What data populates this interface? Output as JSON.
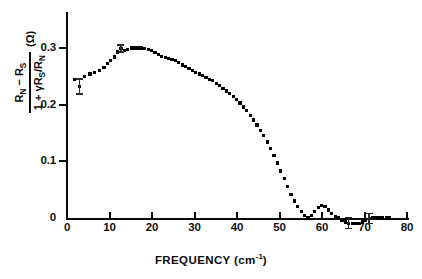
{
  "chart_data": {
    "type": "scatter",
    "title": "",
    "subtitle": "",
    "xlabel": "FREQUENCY (cm-1)",
    "xlabel_main": "FREQUENCY (cm",
    "xlabel_sup": "-1",
    "xlabel_close": ")",
    "ylabel": "(R_N - R_S) / (1 + gamma R_S / R_N)  (Ohm)",
    "ylabel_numerator_pre": "R",
    "ylabel_numerator_sub1": "N",
    "ylabel_numerator_mid": " − R",
    "ylabel_numerator_sub2": "S",
    "ylabel_denominator_pre": "1 + γR",
    "ylabel_denominator_sub1": "S",
    "ylabel_denominator_mid": "/R",
    "ylabel_denominator_sub2": "N",
    "ylabel_units": "(Ω)",
    "xlim": [
      0,
      80
    ],
    "ylim": [
      -0.02,
      0.335
    ],
    "xticks": [
      0,
      10,
      20,
      30,
      40,
      50,
      60,
      70,
      80
    ],
    "xtick_labels": [
      "0",
      "10",
      "20",
      "30",
      "40",
      "50",
      "60",
      "70",
      "80"
    ],
    "yticks": [
      0,
      0.1,
      0.2,
      0.3
    ],
    "ytick_labels": [
      "0",
      "0.1",
      "0.2",
      "0.3"
    ],
    "grid": false,
    "legend": "none",
    "marker": "filled-square",
    "marker_color": "#000000",
    "series": [
      {
        "name": "R_N - R_S normalized",
        "x": [
          1.8,
          3.0,
          4.2,
          5.4,
          6.5,
          7.6,
          8.7,
          9.5,
          10.3,
          11.1,
          11.9,
          12.7,
          13.5,
          14.3,
          15.1,
          15.9,
          16.7,
          17.5,
          18.3,
          19.1,
          19.9,
          20.7,
          21.5,
          22.3,
          23.1,
          23.9,
          24.7,
          25.5,
          26.3,
          27.1,
          27.9,
          28.7,
          29.5,
          30.3,
          31.1,
          31.9,
          32.7,
          33.5,
          34.3,
          35.1,
          35.9,
          36.7,
          37.5,
          38.3,
          39.1,
          39.9,
          40.7,
          41.5,
          42.3,
          43.1,
          43.9,
          44.7,
          45.5,
          46.3,
          47.1,
          47.9,
          48.7,
          49.5,
          50.3,
          51.1,
          51.9,
          52.7,
          53.5,
          54.3,
          55.1,
          55.9,
          56.7,
          57.5,
          58.3,
          59.1,
          59.9,
          60.7,
          61.5,
          62.3,
          63.1,
          63.9,
          64.7,
          65.5,
          66.3,
          67.1,
          67.9,
          68.7,
          69.5,
          70.3,
          71.1,
          71.9,
          72.7,
          73.5,
          74.3,
          75.1,
          75.9
        ],
        "y": [
          0.245,
          0.232,
          0.249,
          0.254,
          0.257,
          0.261,
          0.266,
          0.272,
          0.278,
          0.284,
          0.293,
          0.299,
          0.295,
          0.297,
          0.3,
          0.3,
          0.3,
          0.3,
          0.299,
          0.298,
          0.295,
          0.292,
          0.288,
          0.285,
          0.283,
          0.281,
          0.28,
          0.278,
          0.274,
          0.27,
          0.267,
          0.264,
          0.261,
          0.257,
          0.254,
          0.251,
          0.248,
          0.245,
          0.242,
          0.238,
          0.234,
          0.229,
          0.224,
          0.219,
          0.214,
          0.209,
          0.203,
          0.196,
          0.189,
          0.181,
          0.173,
          0.164,
          0.155,
          0.145,
          0.134,
          0.122,
          0.11,
          0.097,
          0.083,
          0.069,
          0.055,
          0.042,
          0.03,
          0.02,
          0.011,
          0.004,
          0.0,
          0.004,
          0.011,
          0.018,
          0.022,
          0.02,
          0.014,
          0.008,
          0.003,
          0.0,
          -0.004,
          -0.007,
          -0.009,
          -0.01,
          -0.01,
          -0.009,
          -0.007,
          -0.004,
          -0.001,
          0.001,
          0.001,
          0.0,
          0.0,
          0.0,
          0.0
        ]
      }
    ],
    "error_bars": [
      {
        "x": 3.0,
        "y": 0.232,
        "err": 0.013
      },
      {
        "x": 12.7,
        "y": 0.299,
        "err": 0.006
      },
      {
        "x": 66.3,
        "y": -0.009,
        "err": 0.01
      },
      {
        "x": 71.1,
        "y": -0.001,
        "err": 0.009
      }
    ]
  }
}
